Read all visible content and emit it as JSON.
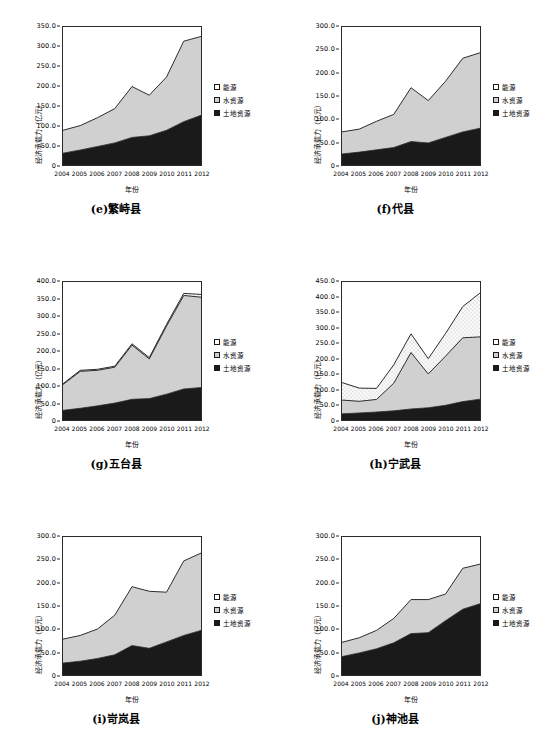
{
  "figure": {
    "axis_titles": {
      "y": "经济承载力（亿元）",
      "x": "年份"
    },
    "legend_labels": {
      "energy": "能源",
      "water": "水资源",
      "land": "土地资源"
    },
    "colors": {
      "energy": "#ffffff",
      "water": "#d0d0d0",
      "land": "#1a1a1a",
      "line": "#2b2b2b",
      "frame": "#2b2b2b"
    },
    "years": [
      "2004",
      "2005",
      "2006",
      "2007",
      "2008",
      "2009",
      "2010",
      "2011",
      "2012"
    ]
  },
  "chart_data": [
    {
      "id": "e",
      "type": "area",
      "title": "(e)繁峙县",
      "xlabel": "年份",
      "ylabel": "经济承载力（亿元）",
      "grid": false,
      "legend_position": "right",
      "x": [
        "2004",
        "2005",
        "2006",
        "2007",
        "2008",
        "2009",
        "2010",
        "2011",
        "2012"
      ],
      "ylim": [
        0,
        350
      ],
      "ytick_step": 50,
      "ytick_labels": [
        "0",
        "50.0",
        "100.0",
        "150.0",
        "200.0",
        "250.0",
        "300.0",
        "350.0"
      ],
      "series": [
        {
          "name": "土地资源",
          "values": [
            30,
            38,
            47,
            56,
            70,
            74,
            88,
            110,
            126
          ]
        },
        {
          "name": "水资源",
          "values": [
            58,
            62,
            73,
            87,
            129,
            103,
            135,
            204,
            200
          ]
        },
        {
          "name": "能源",
          "values": [
            0,
            0,
            0,
            0,
            0,
            0,
            0,
            0,
            0
          ]
        }
      ],
      "totals": [
        88,
        100,
        120,
        143,
        199,
        177,
        223,
        314,
        326
      ]
    },
    {
      "id": "f",
      "type": "area",
      "title": "(f)代县",
      "xlabel": "年份",
      "ylabel": "经济承载力（亿元）",
      "grid": false,
      "legend_position": "right",
      "x": [
        "2004",
        "2005",
        "2006",
        "2007",
        "2008",
        "2009",
        "2010",
        "2011",
        "2012"
      ],
      "ylim": [
        0,
        300
      ],
      "ytick_step": 50,
      "ytick_labels": [
        "0",
        "50.0",
        "100.0",
        "150.0",
        "200.0",
        "250.0",
        "300.0"
      ],
      "series": [
        {
          "name": "土地资源",
          "values": [
            24,
            28,
            33,
            38,
            51,
            48,
            60,
            72,
            80
          ]
        },
        {
          "name": "水资源",
          "values": [
            48,
            50,
            62,
            72,
            117,
            92,
            122,
            160,
            164
          ]
        },
        {
          "name": "能源",
          "values": [
            0,
            0,
            0,
            0,
            0,
            0,
            0,
            0,
            0
          ]
        }
      ],
      "totals": [
        72,
        78,
        95,
        110,
        168,
        140,
        182,
        232,
        244
      ]
    },
    {
      "id": "g",
      "type": "area",
      "title": "(g)五台县",
      "xlabel": "年份",
      "ylabel": "经济承载力（亿元）",
      "grid": false,
      "legend_position": "right",
      "x": [
        "2004",
        "2005",
        "2006",
        "2007",
        "2008",
        "2009",
        "2010",
        "2011",
        "2012"
      ],
      "ylim": [
        0,
        400
      ],
      "ytick_step": 50,
      "ytick_labels": [
        "0",
        "50.0",
        "100.0",
        "150.0",
        "200.0",
        "250.0",
        "300.0",
        "350.0",
        "400.0"
      ],
      "series": [
        {
          "name": "土地资源",
          "values": [
            28,
            34,
            41,
            49,
            60,
            62,
            75,
            90,
            94
          ]
        },
        {
          "name": "水资源",
          "values": [
            75,
            107,
            103,
            104,
            157,
            115,
            197,
            271,
            262
          ]
        },
        {
          "name": "能源",
          "values": [
            2,
            3,
            3,
            3,
            4,
            4,
            5,
            6,
            8
          ]
        }
      ],
      "totals": [
        105,
        144,
        147,
        156,
        221,
        181,
        277,
        367,
        364
      ]
    },
    {
      "id": "h",
      "type": "area",
      "title": "(h)宁武县",
      "xlabel": "年份",
      "ylabel": "经济承载力（亿元）",
      "grid": false,
      "legend_position": "right",
      "x": [
        "2004",
        "2005",
        "2006",
        "2007",
        "2008",
        "2009",
        "2010",
        "2011",
        "2012"
      ],
      "ylim": [
        0,
        450
      ],
      "ytick_step": 50,
      "ytick_labels": [
        "0",
        "50.0",
        "100.0",
        "150.0",
        "200.0",
        "250.0",
        "300.0",
        "350.0",
        "400.0",
        "450.0"
      ],
      "series": [
        {
          "name": "土地资源",
          "values": [
            20,
            23,
            26,
            30,
            36,
            40,
            48,
            60,
            68
          ]
        },
        {
          "name": "水资源",
          "values": [
            45,
            38,
            41,
            90,
            184,
            110,
            160,
            208,
            203
          ]
        },
        {
          "name": "能源",
          "values": [
            57,
            43,
            36,
            60,
            61,
            50,
            74,
            102,
            143
          ]
        }
      ],
      "totals": [
        122,
        104,
        103,
        180,
        281,
        200,
        282,
        370,
        414
      ]
    },
    {
      "id": "i",
      "type": "area",
      "title": "(i)岢岚县",
      "xlabel": "年份",
      "ylabel": "经济承载力（亿元）",
      "grid": false,
      "legend_position": "right",
      "x": [
        "2004",
        "2005",
        "2006",
        "2007",
        "2008",
        "2009",
        "2010",
        "2011",
        "2012"
      ],
      "ylim": [
        0,
        300
      ],
      "ytick_step": 50,
      "ytick_labels": [
        "0",
        "50.0",
        "100.0",
        "150.0",
        "200.0",
        "250.0",
        "300.0"
      ],
      "series": [
        {
          "name": "土地资源",
          "values": [
            26,
            30,
            36,
            44,
            64,
            58,
            72,
            86,
            97
          ]
        },
        {
          "name": "水资源",
          "values": [
            52,
            56,
            64,
            86,
            128,
            124,
            108,
            162,
            168
          ]
        },
        {
          "name": "能源",
          "values": [
            0,
            0,
            0,
            0,
            0,
            0,
            0,
            0,
            0
          ]
        }
      ],
      "totals": [
        78,
        86,
        100,
        130,
        192,
        182,
        180,
        248,
        265
      ]
    },
    {
      "id": "j",
      "type": "area",
      "title": "(j)神池县",
      "xlabel": "年份",
      "ylabel": "经济承载力（亿元）",
      "grid": false,
      "legend_position": "right",
      "x": [
        "2004",
        "2005",
        "2006",
        "2007",
        "2008",
        "2009",
        "2010",
        "2011",
        "2012"
      ],
      "ylim": [
        0,
        300
      ],
      "ytick_step": 50,
      "ytick_labels": [
        "0",
        "50.0",
        "100.0",
        "150.0",
        "200.0",
        "250.0",
        "300.0"
      ],
      "series": [
        {
          "name": "土地资源",
          "values": [
            40,
            48,
            57,
            70,
            90,
            92,
            118,
            143,
            155
          ]
        },
        {
          "name": "水资源",
          "values": [
            31,
            33,
            40,
            53,
            74,
            72,
            58,
            89,
            86
          ]
        },
        {
          "name": "能源",
          "values": [
            0,
            0,
            0,
            0,
            0,
            0,
            0,
            0,
            0
          ]
        }
      ],
      "totals": [
        71,
        81,
        97,
        123,
        164,
        164,
        176,
        232,
        241
      ]
    }
  ]
}
